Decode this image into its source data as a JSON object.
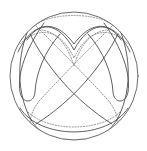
{
  "figure": {
    "background_color": "#ffffff",
    "boundary": {
      "name": "boundary-circle",
      "center_x": 74,
      "center_y": 76,
      "radius": 64,
      "stroke_color": "#5a5a5a",
      "stroke_width": 0.9,
      "style": "solid"
    },
    "styles": {
      "solid_color": "#4e4e4e",
      "solid_width": 0.9,
      "dotted_color": "#8a8a8a",
      "dotted_width": 0.9,
      "dot_pattern": "1.2 1.6"
    },
    "counts": {
      "solid_curves": 10,
      "dotted_curves": 6,
      "total_curves": 16
    },
    "solid_curves": [
      {
        "name": "solid-upper-v-outer",
        "d": "M 18 52 C 30 26 52 14 74 44 C 96 14 118 26 130 52"
      },
      {
        "name": "solid-upper-v-inner",
        "d": "M 27 40 C 38 22 58 20 74 50 C 90 20 110 22 121 40"
      },
      {
        "name": "solid-left-sweep-outer",
        "d": "M 33 19 C 18 48 14 86 30 118 C 40 136 56 142 74 142"
      },
      {
        "name": "solid-right-sweep-outer",
        "d": "M 115 19 C 130 48 134 86 118 118 C 108 136 92 142 74 142"
      },
      {
        "name": "solid-left-hairpin",
        "d": "M 44 23 C 26 48 17 74 20 92 C 22 104 34 104 35 92 C 36 74 44 52 60 34"
      },
      {
        "name": "solid-right-hairpin",
        "d": "M 104 23 C 122 48 131 74 128 92 C 126 104 114 104 113 92 C 112 74 104 52 88 34"
      },
      {
        "name": "solid-diagonal-nw-se",
        "d": "M 30 34 C 46 66 74 100 112 124"
      },
      {
        "name": "solid-diagonal-ne-sw",
        "d": "M 118 34 C 102 66 74 100 36 124"
      },
      {
        "name": "solid-lower-arc-outer",
        "d": "M 20 108 C 40 140 108 140 128 108"
      },
      {
        "name": "solid-lower-arc-inner",
        "d": "M 24 124 C 44 146 104 146 124 124"
      }
    ],
    "dotted_curves": [
      {
        "name": "dotted-top-cap",
        "d": "M 34 26 C 50 12 98 12 114 26"
      },
      {
        "name": "dotted-upper-wide-v",
        "d": "M 20 44 C 38 26 60 28 74 58 C 88 28 110 26 128 44"
      },
      {
        "name": "dotted-upper-narrow-v",
        "d": "M 42 30 C 54 32 66 40 74 66 C 82 40 94 32 106 30"
      },
      {
        "name": "dotted-diagonal-left",
        "d": "M 112 26 C 92 46 62 76 40 100 C 32 110 30 118 30 124"
      },
      {
        "name": "dotted-diagonal-right",
        "d": "M 36 26 C 56 46 86 76 108 100 C 116 110 118 118 118 124"
      },
      {
        "name": "dotted-bottom-sweep",
        "d": "M 28 112 C 48 132 100 132 120 112"
      }
    ]
  }
}
